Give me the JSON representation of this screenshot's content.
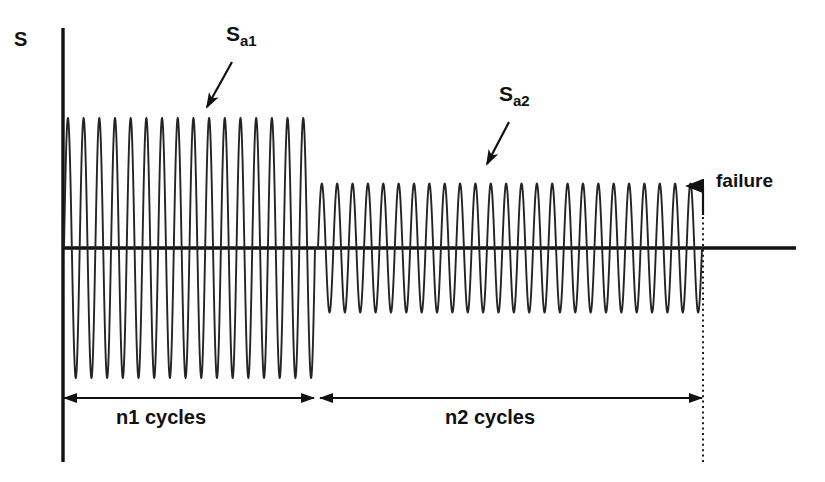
{
  "figure": {
    "axis_label_y": "S",
    "labels": {
      "amplitude_1_main": "S",
      "amplitude_1_sub": "a1",
      "amplitude_2_main": "S",
      "amplitude_2_sub": "a2",
      "failure": "failure",
      "n1_cycles": "n1 cycles",
      "n2_cycles": "n2 cycles"
    },
    "colors": {
      "ink": "#111111",
      "background": "#ffffff",
      "waveform": "#222222"
    }
  },
  "chart_data": {
    "type": "line",
    "xlabel": "",
    "ylabel": "S",
    "grid": false,
    "legend": null,
    "axes": {
      "y_axis_label": "S",
      "zero_line": true,
      "x_axis_values_shown": false,
      "y_axis_values_shown": false
    },
    "annotations": [
      {
        "name": "amplitude-1-callout",
        "text": "Sa1",
        "text_main": "S",
        "text_sub": "a1",
        "points_to": "first stress block"
      },
      {
        "name": "amplitude-2-callout",
        "text": "Sa2",
        "text_main": "S",
        "text_sub": "a2",
        "points_to": "second stress block"
      },
      {
        "name": "failure-callout",
        "text": "failure",
        "points_to": "end of second block"
      },
      {
        "name": "n1-dimension",
        "text": "n1 cycles",
        "span": "start of loading to end of first block"
      },
      {
        "name": "n2-dimension",
        "text": "n2 cycles",
        "span": "end of first block to failure"
      }
    ],
    "series": [
      {
        "name": "Block 1 - high amplitude",
        "waveform": "sinusoidal",
        "amplitude": 1.0,
        "mean": 0,
        "cycles": 16,
        "cycles_label": "n1 cycles"
      },
      {
        "name": "Block 2 - low amplitude",
        "waveform": "sinusoidal",
        "amplitude": 0.51,
        "mean": 0,
        "cycles": 25,
        "cycles_label": "n2 cycles"
      }
    ],
    "ylim": [
      -1.15,
      1.15
    ],
    "xlim": [
      0,
      41
    ]
  }
}
